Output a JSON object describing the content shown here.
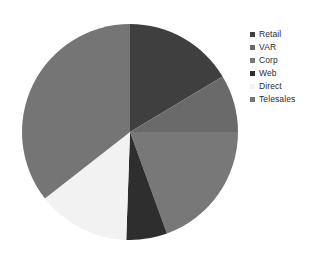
{
  "chart_data": {
    "type": "pie",
    "title": "",
    "subtitle": "",
    "xlabel": "",
    "ylabel": "",
    "grid": false,
    "legend_position": "right",
    "start_angle_deg": 0,
    "direction": "clockwise",
    "categories": [
      "Retail",
      "VAR",
      "Corp",
      "Web",
      "Direct",
      "Telesales"
    ],
    "values": [
      16.4,
      8.6,
      19.4,
      6.1,
      13.9,
      35.6
    ],
    "units": "percent",
    "slices": [
      {
        "label": "Retail",
        "value": 16.4,
        "start_deg": 0,
        "end_deg": 59,
        "color": "#3f3f3f"
      },
      {
        "label": "VAR",
        "value": 8.6,
        "start_deg": 59,
        "end_deg": 90,
        "color": "#6a6a6a"
      },
      {
        "label": "Corp",
        "value": 19.4,
        "start_deg": 90,
        "end_deg": 160,
        "color": "#787878"
      },
      {
        "label": "Web",
        "value": 6.1,
        "start_deg": 160,
        "end_deg": 182,
        "color": "#2e2e2e"
      },
      {
        "label": "Direct",
        "value": 13.9,
        "start_deg": 182,
        "end_deg": 232,
        "color": "#f2f2f2"
      },
      {
        "label": "Telesales",
        "value": 35.6,
        "start_deg": 232,
        "end_deg": 360,
        "color": "#757575"
      }
    ]
  },
  "legend": {
    "items": [
      {
        "label": "Retail",
        "marker_color": "#3f3f3f",
        "marker": "square-marker"
      },
      {
        "label": "VAR",
        "marker_color": "#6a6a6a",
        "marker": "square-marker"
      },
      {
        "label": "Corp",
        "marker_color": "#787878",
        "marker": "square-marker"
      },
      {
        "label": "Web",
        "marker_color": "#2e2e2e",
        "marker": "square-marker"
      },
      {
        "label": "Direct",
        "marker_color": "#f2f2f2",
        "marker": "square-marker"
      },
      {
        "label": "Telesales",
        "marker_color": "#757575",
        "marker": "square-marker"
      }
    ]
  },
  "canvas": {
    "background": "#ffffff",
    "center_x": 130,
    "center_y": 132,
    "radius": 108
  }
}
